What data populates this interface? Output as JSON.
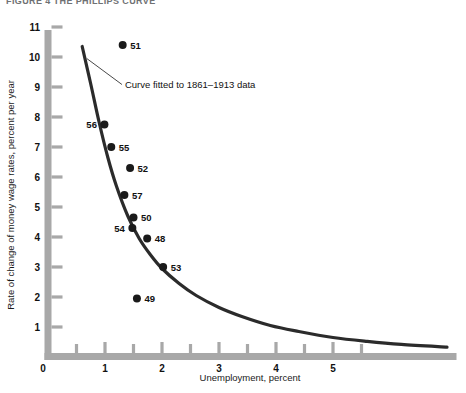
{
  "figure": {
    "title": "FIGURE 4   THE PHILLIPS CURVE"
  },
  "chart_data": {
    "type": "scatter",
    "title": "",
    "xlabel": "Unemployment, percent",
    "ylabel": "Rate of change of money wage rates, percent per year",
    "xlim": [
      0,
      7.3
    ],
    "ylim": [
      0,
      11.5
    ],
    "xticks": [
      0,
      1,
      2,
      3,
      4,
      5
    ],
    "xtick_labels": [
      "0",
      "1",
      "2",
      "3",
      "4",
      "5"
    ],
    "x_minor_ticks": [
      0.5,
      1.5,
      2.5,
      3.5,
      4.5,
      5.5
    ],
    "yticks": [
      1,
      2,
      3,
      4,
      5,
      6,
      7,
      8,
      9,
      10,
      11
    ],
    "ytick_labels": [
      "1",
      "2",
      "3",
      "4",
      "5",
      "6",
      "7",
      "8",
      "9",
      "10",
      "11"
    ],
    "grid": false,
    "legend": false,
    "annotations": [
      {
        "text": "Curve fitted to 1861–1913 data",
        "x": 1.35,
        "y": 9.1,
        "leader_to_x": 0.68,
        "leader_to_y": 9.95
      }
    ],
    "series": [
      {
        "name": "Annual observations 1948–1957",
        "marker": "filled-circle",
        "color": "#1a1a1a",
        "points": [
          {
            "label": "51",
            "x": 1.31,
            "y": 10.4,
            "label_side": "right"
          },
          {
            "label": "56",
            "x": 0.99,
            "y": 7.75,
            "label_side": "left"
          },
          {
            "label": "55",
            "x": 1.11,
            "y": 7.0,
            "label_side": "right"
          },
          {
            "label": "52",
            "x": 1.44,
            "y": 6.3,
            "label_side": "right"
          },
          {
            "label": "57",
            "x": 1.34,
            "y": 5.4,
            "label_side": "right"
          },
          {
            "label": "50",
            "x": 1.5,
            "y": 4.65,
            "label_side": "right"
          },
          {
            "label": "54",
            "x": 1.48,
            "y": 4.3,
            "label_side": "left"
          },
          {
            "label": "48",
            "x": 1.74,
            "y": 3.95,
            "label_side": "right"
          },
          {
            "label": "53",
            "x": 2.02,
            "y": 3.0,
            "label_side": "right"
          },
          {
            "label": "49",
            "x": 1.56,
            "y": 1.95,
            "label_side": "right"
          }
        ]
      }
    ],
    "fitted_curve": {
      "name": "Curve fitted to 1861–1913 data",
      "color": "#2b2b2b",
      "width_px": 3.2,
      "x": [
        0.6,
        0.75,
        0.9,
        1.05,
        1.2,
        1.4,
        1.6,
        1.8,
        2.0,
        2.3,
        2.6,
        3.0,
        3.4,
        3.9,
        4.4,
        5.0,
        5.6,
        6.2,
        7.0
      ],
      "y": [
        10.35,
        9.1,
        7.8,
        6.65,
        5.7,
        4.7,
        3.95,
        3.4,
        2.95,
        2.45,
        2.05,
        1.65,
        1.35,
        1.05,
        0.85,
        0.65,
        0.52,
        0.42,
        0.33
      ]
    },
    "axis_style": {
      "bar_color": "#a8a8a8",
      "tick_color": "#a8a8a8",
      "bar_thickness_px": 7
    }
  }
}
